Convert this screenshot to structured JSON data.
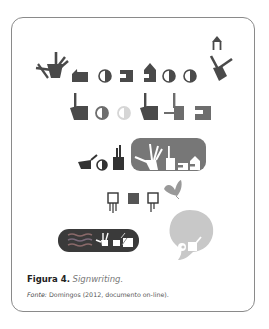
{
  "figure": {
    "label": "Figura 4.",
    "title": "Signwriting.",
    "source_label": "Fonte:",
    "source_text": "Domingos (2012, documento on-line)."
  },
  "colors": {
    "frame_border": "#8a8a8a",
    "glyph_dark": "#4a4a4a",
    "glyph_mid": "#6d6d6d",
    "glyph_light": "#d6d6d6",
    "panel_mid": "#777777",
    "panel_dark": "#3a3a3a",
    "bubble": "#c8c8c8"
  },
  "rows": [
    {
      "name": "row-1",
      "glyphs": [
        "hand-spread",
        "square-hook",
        "half-circle",
        "bracket-square",
        "house-square",
        "half-circle",
        "half-circle",
        "hand-with-arrow"
      ]
    },
    {
      "name": "row-2",
      "glyphs": [
        "pointing-hand",
        "half-circle",
        "faint-circle",
        "pointing-hand",
        "dash-square",
        "bracket-square"
      ]
    },
    {
      "name": "row-3",
      "glyphs": [
        "cup-hand",
        "half-circle",
        "raised-hand",
        "highlighted-word-panel"
      ]
    },
    {
      "name": "row-4",
      "glyphs": [
        "square-legs",
        "solid-square",
        "square-legs",
        "butterfly"
      ]
    },
    {
      "name": "row-5",
      "glyphs": [
        "wave-panel",
        "speech-bubble"
      ]
    }
  ]
}
